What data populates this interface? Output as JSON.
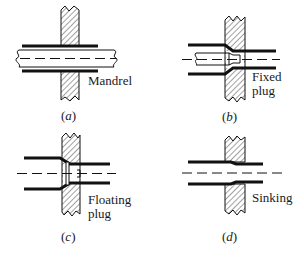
{
  "figure": {
    "colors": {
      "line": "#111111",
      "hatch": "#444444",
      "background": "#ffffff"
    },
    "panels": [
      {
        "id": "a",
        "caption_open": "(",
        "caption_letter": "a",
        "caption_close": ")",
        "label_line1": "Mandrel",
        "label_line2": ""
      },
      {
        "id": "b",
        "caption_open": "(",
        "caption_letter": "b",
        "caption_close": ")",
        "label_line1": "Fixed",
        "label_line2": "plug"
      },
      {
        "id": "c",
        "caption_open": "(",
        "caption_letter": "c",
        "caption_close": ")",
        "label_line1": "Floating",
        "label_line2": "plug"
      },
      {
        "id": "d",
        "caption_open": "(",
        "caption_letter": "d",
        "caption_close": ")",
        "label_line1": "Sinking",
        "label_line2": ""
      }
    ]
  }
}
